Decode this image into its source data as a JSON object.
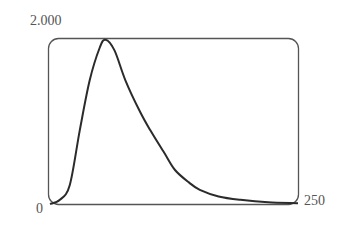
{
  "chart_data": {
    "type": "line",
    "title": "",
    "xlabel": "",
    "ylabel": "",
    "xlim": [
      0,
      250
    ],
    "ylim": [
      0,
      2
    ],
    "grid": false,
    "legend": null,
    "tick_labels": {
      "y_max": "2.000",
      "origin": "0",
      "x_max": "250"
    },
    "series": [
      {
        "name": "curve",
        "x": [
          0,
          10,
          20,
          30,
          40,
          50,
          56,
          65,
          76,
          90,
          101,
          115,
          126,
          140,
          151,
          170,
          192,
          220,
          250
        ],
        "y": [
          0,
          0.05,
          0.23,
          0.89,
          1.49,
          1.88,
          1.98,
          1.85,
          1.49,
          1.13,
          0.89,
          0.62,
          0.41,
          0.26,
          0.17,
          0.09,
          0.05,
          0.02,
          0.01
        ]
      }
    ],
    "colors": {
      "line": "#2b2b2b",
      "frame": "#555555",
      "text": "#555555"
    }
  }
}
